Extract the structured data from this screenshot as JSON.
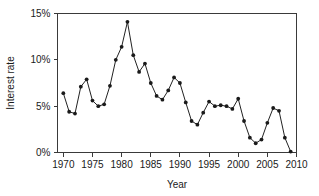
{
  "chart_data": {
    "type": "line",
    "title": "",
    "xlabel": "Year",
    "ylabel": "Interest rate",
    "xlim": [
      1969,
      2010
    ],
    "ylim": [
      0,
      15
    ],
    "grid": false,
    "legend": null,
    "x_tick_labels": [
      "1970",
      "1975",
      "1980",
      "1985",
      "1990",
      "1995",
      "2000",
      "2005",
      "2010"
    ],
    "x_ticks": [
      1970,
      1975,
      1980,
      1985,
      1990,
      1995,
      2000,
      2005,
      2010
    ],
    "y_tick_labels": [
      "0%",
      "5%",
      "10%",
      "15%"
    ],
    "y_ticks": [
      0,
      5,
      10,
      15
    ],
    "marker": "filled-circle",
    "x": [
      1970,
      1971,
      1972,
      1973,
      1974,
      1975,
      1976,
      1977,
      1978,
      1979,
      1980,
      1981,
      1982,
      1983,
      1984,
      1985,
      1986,
      1987,
      1988,
      1989,
      1990,
      1991,
      1992,
      1993,
      1994,
      1995,
      1996,
      1997,
      1998,
      1999,
      2000,
      2001,
      2002,
      2003,
      2004,
      2005,
      2006,
      2007,
      2008,
      2009
    ],
    "values": [
      6.4,
      4.4,
      4.2,
      7.1,
      7.9,
      5.6,
      5.0,
      5.2,
      7.2,
      10.0,
      11.4,
      14.1,
      10.5,
      8.7,
      9.6,
      7.5,
      6.1,
      5.7,
      6.7,
      8.1,
      7.5,
      5.4,
      3.4,
      3.0,
      4.3,
      5.5,
      5.0,
      5.1,
      5.0,
      4.7,
      5.8,
      3.4,
      1.6,
      1.0,
      1.4,
      3.2,
      4.8,
      4.5,
      1.6,
      0.1
    ]
  },
  "axis_titles": {
    "x": "Year",
    "y": "Interest rate"
  }
}
